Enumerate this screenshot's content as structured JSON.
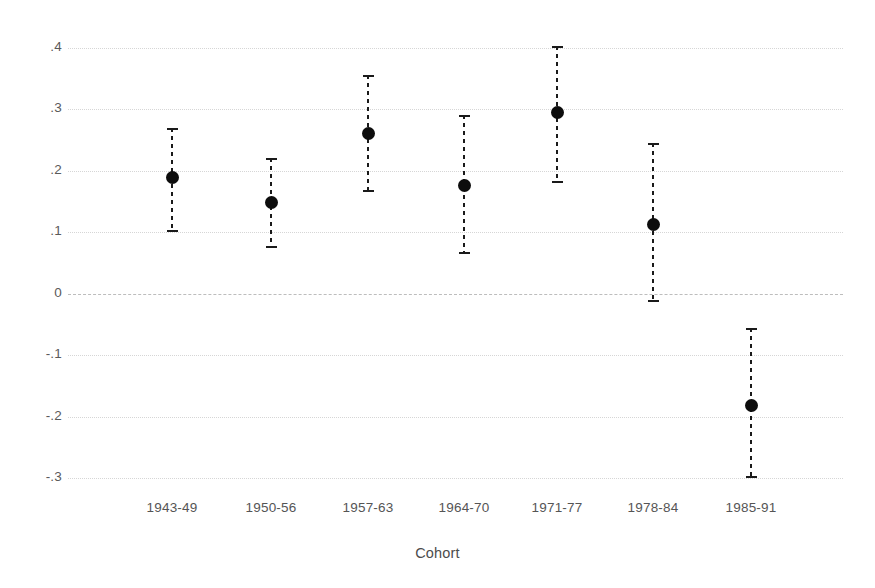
{
  "chart_data": {
    "type": "scatter",
    "title": "",
    "subtitle": "",
    "xlabel": "Cohort",
    "ylabel": "",
    "categories": [
      "1943-49",
      "1950-56",
      "1957-63",
      "1964-70",
      "1971-77",
      "1978-84",
      "1985-91"
    ],
    "values": [
      0.19,
      0.149,
      0.261,
      0.176,
      0.295,
      0.112,
      -0.182
    ],
    "ci_lower": [
      0.101,
      0.074,
      0.166,
      0.065,
      0.181,
      -0.014,
      -0.3
    ],
    "ci_upper": [
      0.27,
      0.221,
      0.356,
      0.291,
      0.404,
      0.245,
      -0.055
    ],
    "series": [
      {
        "name": "Point estimate with 95% CI",
        "points": [
          {
            "category": "1943-49",
            "value": 0.19,
            "ci_lower": 0.101,
            "ci_upper": 0.27
          },
          {
            "category": "1950-56",
            "value": 0.149,
            "ci_lower": 0.074,
            "ci_upper": 0.221
          },
          {
            "category": "1957-63",
            "value": 0.261,
            "ci_lower": 0.166,
            "ci_upper": 0.356
          },
          {
            "category": "1964-70",
            "value": 0.176,
            "ci_lower": 0.065,
            "ci_upper": 0.291
          },
          {
            "category": "1971-77",
            "value": 0.295,
            "ci_lower": 0.181,
            "ci_upper": 0.404
          },
          {
            "category": "1978-84",
            "value": 0.112,
            "ci_lower": -0.014,
            "ci_upper": 0.245
          },
          {
            "category": "1985-91",
            "value": -0.182,
            "ci_lower": -0.3,
            "ci_upper": -0.055
          }
        ]
      }
    ],
    "yticks": [
      0.4,
      0.3,
      0.2,
      0.1,
      0,
      -0.1,
      -0.2,
      -0.3
    ],
    "ytick_labels": [
      ".4",
      ".3",
      ".2",
      ".1",
      "0",
      "-.1",
      "-.2",
      "-.3"
    ],
    "ylim": [
      -0.34,
      0.44
    ],
    "grid": true,
    "zero_reference_line": true,
    "legend": "none",
    "marker_color": "#0d0d0d",
    "grid_color": "#d6d6d6",
    "background_color": "#ffffff"
  }
}
